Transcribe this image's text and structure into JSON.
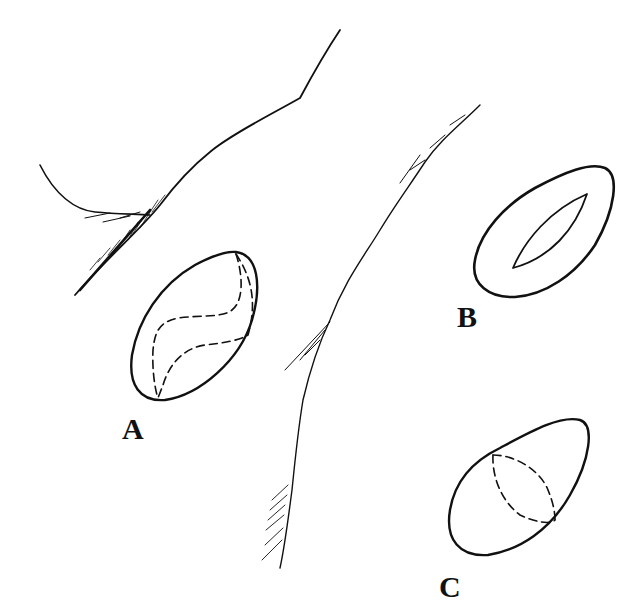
{
  "figure": {
    "background": "#ffffff",
    "stroke_color": "#111111",
    "labels": {
      "a": "A",
      "b": "B",
      "c": "C"
    },
    "elements": [
      {
        "id": "A",
        "description": "oval outline with dashed internal S-shaped curves"
      },
      {
        "id": "B",
        "description": "oval outline with inner lens/eye-shaped opening"
      },
      {
        "id": "C",
        "description": "oval outline with dashed band across middle"
      }
    ]
  }
}
